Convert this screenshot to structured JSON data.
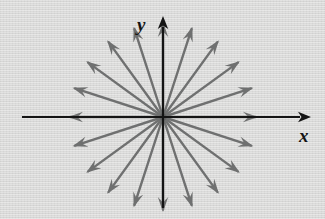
{
  "figure": {
    "background_color": "#dadad9",
    "width": 325,
    "height": 219
  },
  "axes": {
    "color": "#141414",
    "origin": {
      "x": 163,
      "y": 117
    },
    "x_axis": {
      "label": "x",
      "start_x": 22,
      "end_x": 311,
      "y": 117,
      "arrowhead": "right",
      "label_position": {
        "x": 299,
        "y": 126
      }
    },
    "y_axis": {
      "label": "y",
      "start_y": 208,
      "end_y": 16,
      "x": 163,
      "arrowhead": "up",
      "label_position": {
        "x": 137,
        "y": 15
      }
    }
  },
  "vector_field": {
    "description": "Twenty outward-pointing arrows radiating from the origin",
    "arrow_color": "#6f7070",
    "arrow_count": 20,
    "angle_step_degrees": 18,
    "radius": 95,
    "shaft_width": 2.4,
    "arrowhead_style": "barbed",
    "angles_degrees": [
      0,
      18,
      36,
      54,
      72,
      108,
      126,
      144,
      162,
      180,
      198,
      216,
      234,
      252,
      270,
      288,
      306,
      324,
      342,
      90
    ],
    "note": "Arrows point radially outward from origin, equally spaced around the circle"
  },
  "chart_data": {
    "type": "scatter",
    "xlabel": "x",
    "ylabel": "y",
    "grid": false,
    "legend": "none",
    "vectors": [
      {
        "angle_deg": 0,
        "dx": 1.0,
        "dy": 0.0
      },
      {
        "angle_deg": 18,
        "dx": 0.951,
        "dy": 0.309
      },
      {
        "angle_deg": 36,
        "dx": 0.809,
        "dy": 0.588
      },
      {
        "angle_deg": 54,
        "dx": 0.588,
        "dy": 0.809
      },
      {
        "angle_deg": 72,
        "dx": 0.309,
        "dy": 0.951
      },
      {
        "angle_deg": 90,
        "dx": 0.0,
        "dy": 1.0
      },
      {
        "angle_deg": 108,
        "dx": -0.309,
        "dy": 0.951
      },
      {
        "angle_deg": 126,
        "dx": -0.588,
        "dy": 0.809
      },
      {
        "angle_deg": 144,
        "dx": -0.809,
        "dy": 0.588
      },
      {
        "angle_deg": 162,
        "dx": -0.951,
        "dy": 0.309
      },
      {
        "angle_deg": 180,
        "dx": -1.0,
        "dy": 0.0
      },
      {
        "angle_deg": 198,
        "dx": -0.951,
        "dy": -0.309
      },
      {
        "angle_deg": 216,
        "dx": -0.809,
        "dy": -0.588
      },
      {
        "angle_deg": 234,
        "dx": -0.588,
        "dy": -0.809
      },
      {
        "angle_deg": 252,
        "dx": -0.309,
        "dy": -0.951
      },
      {
        "angle_deg": 270,
        "dx": 0.0,
        "dy": -1.0
      },
      {
        "angle_deg": 288,
        "dx": 0.309,
        "dy": -0.951
      },
      {
        "angle_deg": 306,
        "dx": 0.588,
        "dy": -0.809
      },
      {
        "angle_deg": 324,
        "dx": 0.809,
        "dy": -0.588
      },
      {
        "angle_deg": 342,
        "dx": 0.951,
        "dy": -0.309
      }
    ],
    "magnitude": 1.0,
    "xlim": [
      -1.5,
      1.7
    ],
    "ylim": [
      -1.1,
      1.1
    ]
  }
}
